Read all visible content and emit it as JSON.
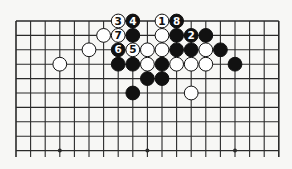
{
  "diagram": {
    "type": "go-board-partial",
    "board_columns": 19,
    "visible_rows": 10,
    "edges": {
      "top": true,
      "left": true,
      "right": true,
      "bottom": false
    },
    "colors": {
      "background": "#f7f7f5",
      "line": "#2a2a2a",
      "black": "#111111",
      "white": "#ffffff"
    },
    "star_points": [
      {
        "col": 3,
        "row": 9
      },
      {
        "col": 9,
        "row": 9
      },
      {
        "col": 15,
        "row": 9
      }
    ],
    "stones": [
      {
        "col": 7,
        "row": 0,
        "color": "white",
        "label": "3"
      },
      {
        "col": 8,
        "row": 0,
        "color": "black",
        "label": "4"
      },
      {
        "col": 10,
        "row": 0,
        "color": "white",
        "label": "1"
      },
      {
        "col": 11,
        "row": 0,
        "color": "black",
        "label": "8"
      },
      {
        "col": 6,
        "row": 1,
        "color": "white",
        "label": ""
      },
      {
        "col": 7,
        "row": 1,
        "color": "white",
        "label": "7"
      },
      {
        "col": 8,
        "row": 1,
        "color": "black",
        "label": ""
      },
      {
        "col": 10,
        "row": 1,
        "color": "white",
        "label": ""
      },
      {
        "col": 11,
        "row": 1,
        "color": "black",
        "label": ""
      },
      {
        "col": 12,
        "row": 1,
        "color": "black",
        "label": "2"
      },
      {
        "col": 13,
        "row": 1,
        "color": "black",
        "label": ""
      },
      {
        "col": 5,
        "row": 2,
        "color": "white",
        "label": ""
      },
      {
        "col": 7,
        "row": 2,
        "color": "black",
        "label": "6"
      },
      {
        "col": 8,
        "row": 2,
        "color": "white",
        "label": "5"
      },
      {
        "col": 9,
        "row": 2,
        "color": "white",
        "label": ""
      },
      {
        "col": 10,
        "row": 2,
        "color": "white",
        "label": ""
      },
      {
        "col": 11,
        "row": 2,
        "color": "black",
        "label": ""
      },
      {
        "col": 12,
        "row": 2,
        "color": "black",
        "label": ""
      },
      {
        "col": 13,
        "row": 2,
        "color": "white",
        "label": ""
      },
      {
        "col": 14,
        "row": 2,
        "color": "black",
        "label": ""
      },
      {
        "col": 3,
        "row": 3,
        "color": "white",
        "label": ""
      },
      {
        "col": 7,
        "row": 3,
        "color": "black",
        "label": ""
      },
      {
        "col": 8,
        "row": 3,
        "color": "black",
        "label": ""
      },
      {
        "col": 9,
        "row": 3,
        "color": "white",
        "label": ""
      },
      {
        "col": 10,
        "row": 3,
        "color": "black",
        "label": ""
      },
      {
        "col": 11,
        "row": 3,
        "color": "white",
        "label": ""
      },
      {
        "col": 12,
        "row": 3,
        "color": "white",
        "label": ""
      },
      {
        "col": 13,
        "row": 3,
        "color": "white",
        "label": ""
      },
      {
        "col": 15,
        "row": 3,
        "color": "black",
        "label": ""
      },
      {
        "col": 9,
        "row": 4,
        "color": "black",
        "label": ""
      },
      {
        "col": 10,
        "row": 4,
        "color": "black",
        "label": ""
      },
      {
        "col": 8,
        "row": 5,
        "color": "black",
        "label": ""
      },
      {
        "col": 12,
        "row": 5,
        "color": "white",
        "label": ""
      }
    ]
  }
}
